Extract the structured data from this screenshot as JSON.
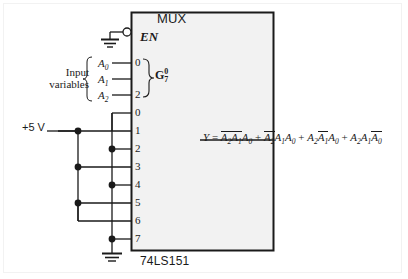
{
  "figure": {
    "type": "logic-circuit-schematic"
  },
  "chip": {
    "title": "MUX",
    "part_number": "74LS151",
    "enable_pin_label": "EN",
    "enable_active_low": true,
    "enable_connected_to": "ground"
  },
  "select_group": {
    "label_base": "G",
    "superscript": "0",
    "subscript": "7",
    "pins": [
      {
        "number": "0",
        "signal": "A0"
      },
      {
        "number": "1",
        "signal": "A1"
      },
      {
        "number": "2",
        "signal": "A2"
      }
    ],
    "shown_pin_numbers": [
      "0",
      "2"
    ]
  },
  "inputs": {
    "group_label_line1": "Input",
    "group_label_line2": "variables",
    "variables": [
      "A",
      "A",
      "A"
    ],
    "subscripts": [
      "0",
      "1",
      "2"
    ]
  },
  "power": {
    "supply_label": "+5 V"
  },
  "data_pins": [
    {
      "number": "0",
      "level": "high"
    },
    {
      "number": "1",
      "level": "low"
    },
    {
      "number": "2",
      "level": "high"
    },
    {
      "number": "3",
      "level": "low"
    },
    {
      "number": "4",
      "level": "high"
    },
    {
      "number": "5",
      "level": "low"
    },
    {
      "number": "6",
      "level": "low"
    },
    {
      "number": "7",
      "level": "high"
    }
  ],
  "output": {
    "name": "Y",
    "equation_plain": "Y = A2'A1'A0 + A2'A1A0 + A2A1'A0 + A2A1A0'",
    "terms": [
      {
        "factors": [
          {
            "v": "A",
            "sub": "2",
            "bar": true
          },
          {
            "v": "A",
            "sub": "1",
            "bar": true
          },
          {
            "v": "A",
            "sub": "0",
            "bar": false
          }
        ]
      },
      {
        "factors": [
          {
            "v": "A",
            "sub": "2",
            "bar": true
          },
          {
            "v": "A",
            "sub": "1",
            "bar": false
          },
          {
            "v": "A",
            "sub": "0",
            "bar": false
          }
        ]
      },
      {
        "factors": [
          {
            "v": "A",
            "sub": "2",
            "bar": false
          },
          {
            "v": "A",
            "sub": "1",
            "bar": true
          },
          {
            "v": "A",
            "sub": "0",
            "bar": false
          }
        ]
      },
      {
        "factors": [
          {
            "v": "A",
            "sub": "2",
            "bar": false
          },
          {
            "v": "A",
            "sub": "1",
            "bar": false
          },
          {
            "v": "A",
            "sub": "0",
            "bar": true
          }
        ]
      }
    ]
  },
  "colors": {
    "wire": "#1a1a1a",
    "chip_fill": "#f2f2f2",
    "chip_border": "#1a1a1a",
    "text": "#1a1a1a",
    "frame": "#f2f2f2",
    "background": "#ffffff"
  }
}
